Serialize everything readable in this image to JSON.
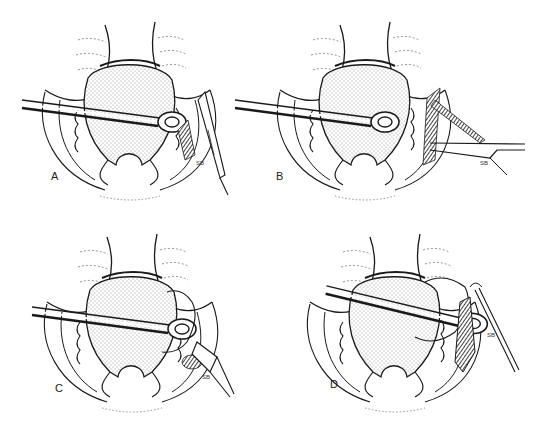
{
  "figure": {
    "panels": [
      {
        "id": "A",
        "label": "A",
        "instrument_label": "SB",
        "instrument": "scalpel"
      },
      {
        "id": "B",
        "label": "B",
        "instrument_label": "SB",
        "instrument": "scissors"
      },
      {
        "id": "C",
        "label": "C",
        "instrument_label": "SB",
        "instrument": "retractor"
      },
      {
        "id": "D",
        "label": "D",
        "instrument_label": "SB",
        "instrument": "probe"
      }
    ],
    "colors": {
      "ink": "#1a1a1a",
      "stipple": "#8a8a8a",
      "background": "#ffffff"
    }
  }
}
